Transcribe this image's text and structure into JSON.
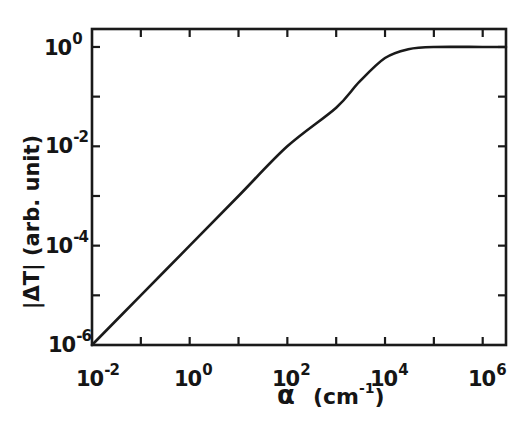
{
  "chart_data": {
    "type": "line",
    "title": "",
    "xlabel": "α (cm⁻¹)",
    "ylabel": "|ΔT| (arb. unit)",
    "xscale": "log",
    "yscale": "log",
    "xlim": [
      0.01,
      3000000
    ],
    "ylim": [
      1e-06,
      2.3
    ],
    "grid": false,
    "legend": null,
    "x_ticks": [
      "10^-2",
      "10^0",
      "10^2",
      "10^4",
      "10^6"
    ],
    "y_ticks": [
      "10^-6",
      "10^-4",
      "10^-2",
      "10^0"
    ],
    "series": [
      {
        "name": "|ΔT| vs α",
        "x": [
          0.01,
          0.1,
          1,
          10,
          100,
          1000,
          3000,
          10000,
          30000,
          100000,
          1000000,
          3000000
        ],
        "y": [
          1e-06,
          1e-05,
          0.0001,
          0.001,
          0.01,
          0.06,
          0.2,
          0.6,
          0.9,
          1.0,
          1.0,
          1.0
        ]
      }
    ]
  },
  "axes": {
    "x": {
      "label_symbol": "α",
      "label_unit_base": "(cm",
      "label_unit_exp": "-1",
      "label_unit_close": ")",
      "ticks": [
        {
          "base": "10",
          "exp": "-2"
        },
        {
          "base": "10",
          "exp": "0"
        },
        {
          "base": "10",
          "exp": "2"
        },
        {
          "base": "10",
          "exp": "4"
        },
        {
          "base": "10",
          "exp": "6"
        }
      ]
    },
    "y": {
      "label": "|ΔT| (arb. unit)",
      "ticks": [
        {
          "base": "10",
          "exp": "0"
        },
        {
          "base": "10",
          "exp": "-2"
        },
        {
          "base": "10",
          "exp": "-4"
        },
        {
          "base": "10",
          "exp": "-6"
        }
      ]
    }
  },
  "colors": {
    "line": "#1a1a1a",
    "frame": "#1a1a1a",
    "background": "#ffffff"
  }
}
